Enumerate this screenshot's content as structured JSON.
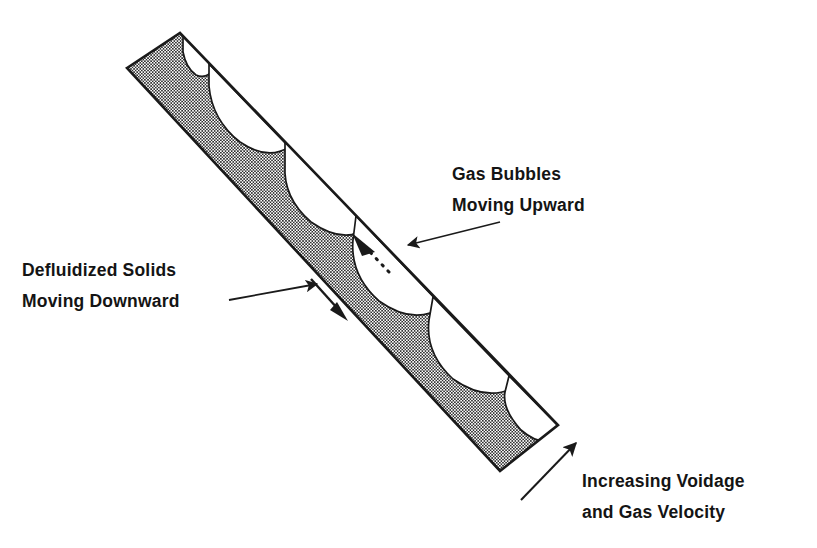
{
  "figure": {
    "background_color": "#ffffff",
    "line_color": "#1a1a1a",
    "hatch_color": "#2b2b2b",
    "hatch_fill_color": "#c9c9c9",
    "void_color": "#ffffff",
    "width": 817,
    "height": 548
  },
  "labels": {
    "gas_bubbles": {
      "line1": "Gas Bubbles",
      "line2": "Moving Upward",
      "x": 452,
      "y": 174
    },
    "defluidized_solids": {
      "line1": "Defluidized Solids",
      "line2": "Moving Downward",
      "x": 22,
      "y": 270
    },
    "increasing_voidage": {
      "line1": "Increasing Voidage",
      "line2": "and Gas Velocity",
      "x": 582,
      "y": 481
    }
  },
  "column": {
    "description": "Inclined rectangular duct, hatched, tilted about 40 degrees from horizontal",
    "corner_top_left": [
      127,
      68
    ],
    "corner_top_right": [
      180,
      33
    ],
    "corner_bottom_right": [
      558,
      425
    ],
    "corner_bottom_left": [
      500,
      471
    ],
    "inclination_degrees": 40
  },
  "bubbles": [
    {
      "index": 1,
      "size": "smallest",
      "center": [
        199,
        67
      ]
    },
    {
      "index": 2,
      "size": "small",
      "center": [
        248,
        109
      ]
    },
    {
      "index": 3,
      "size": "medium",
      "center": [
        318,
        172
      ]
    },
    {
      "index": 4,
      "size": "large",
      "center": [
        389,
        243
      ]
    },
    {
      "index": 5,
      "size": "larger",
      "center": [
        459,
        318
      ]
    },
    {
      "index": 6,
      "size": "largest",
      "center": [
        524,
        392
      ]
    }
  ],
  "arrows": {
    "gas_bubbles_pointer": {
      "name": "gas-bubbles-pointer-arrow",
      "from": [
        500,
        222
      ],
      "to": [
        404,
        246
      ],
      "head": "solid"
    },
    "defluidized_solids_pointer": {
      "name": "defluidized-solids-pointer-arrow",
      "from": [
        229,
        300
      ],
      "to": [
        320,
        283
      ],
      "head": "solid"
    },
    "bubble_rise": {
      "name": "bubble-rise-dashed-arrow",
      "from": [
        385,
        267
      ],
      "to": [
        357,
        239
      ],
      "head": "solid",
      "style": "dashed"
    },
    "solids_downflow": {
      "name": "solids-downflow-arrow",
      "from": [
        311,
        279
      ],
      "to": [
        345,
        317
      ],
      "head": "solid"
    },
    "increasing_voidage_pointer": {
      "name": "increasing-voidage-arrow",
      "from": [
        521,
        500
      ],
      "to": [
        578,
        441
      ],
      "head": "solid"
    }
  }
}
